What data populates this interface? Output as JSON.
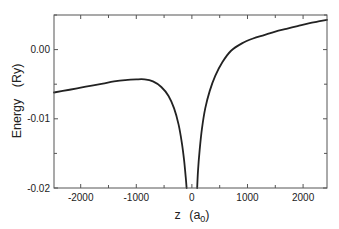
{
  "chart_data": {
    "type": "line",
    "title": "",
    "xlabel": "z",
    "xlabel_unit": "a",
    "xlabel_unit_sub": "0",
    "ylabel": "Energy",
    "ylabel_unit": "(Ry)",
    "xlim": [
      -2480,
      2430
    ],
    "ylim": [
      -0.02,
      0.005
    ],
    "x_ticks": [
      -2000,
      -1000,
      0,
      1000,
      2000
    ],
    "x_tick_labels": [
      "-2000",
      "-1000",
      "0",
      "1000",
      "2000"
    ],
    "x_minor_ticks": [
      -2500,
      -1500,
      -500,
      500,
      1500
    ],
    "y_ticks": [
      0.0,
      -0.01,
      -0.02
    ],
    "y_tick_labels": [
      "0.00",
      "-0.01",
      "-0.02"
    ],
    "y_minor_ticks": [
      0.005,
      -0.005,
      -0.015
    ],
    "grid": false,
    "legend": null,
    "line_color": "#222222",
    "series": [
      {
        "name": "energy-left-branch",
        "x": [
          -2480,
          -2200,
          -2000,
          -1800,
          -1600,
          -1400,
          -1200,
          -1000,
          -850,
          -700,
          -550,
          -420,
          -320,
          -240,
          -180,
          -140,
          -110,
          -95
        ],
        "y": [
          -0.0062,
          -0.0058,
          -0.0055,
          -0.0052,
          -0.0049,
          -0.0046,
          -0.0044,
          -0.0043,
          -0.0043,
          -0.0046,
          -0.0054,
          -0.0067,
          -0.0085,
          -0.0108,
          -0.0135,
          -0.016,
          -0.0185,
          -0.02
        ]
      },
      {
        "name": "energy-right-branch",
        "x": [
          95,
          110,
          140,
          180,
          240,
          320,
          420,
          550,
          700,
          900,
          1100,
          1300,
          1500,
          1700,
          1900,
          2100,
          2300,
          2430
        ],
        "y": [
          -0.02,
          -0.0175,
          -0.0145,
          -0.0115,
          -0.0085,
          -0.006,
          -0.0038,
          -0.0018,
          -0.0002,
          0.0009,
          0.0016,
          0.0021,
          0.0026,
          0.003,
          0.0034,
          0.0038,
          0.0041,
          0.0043
        ]
      }
    ]
  }
}
